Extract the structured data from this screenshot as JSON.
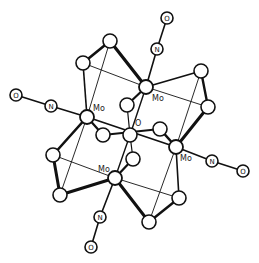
{
  "diagram": {
    "title": "",
    "colors": {
      "stroke": "#111111",
      "fill": "#ffffff",
      "background": "#ffffff"
    },
    "atoms": [
      {
        "id": "mo_top",
        "element": "Mo",
        "label": "Mo",
        "x": 146,
        "y": 87,
        "r": 7,
        "show_label": true,
        "label_dx": 6,
        "label_dy": 14
      },
      {
        "id": "mo_left",
        "element": "Mo",
        "label": "Mo",
        "x": 87,
        "y": 117,
        "r": 7,
        "show_label": true,
        "label_dx": 6,
        "label_dy": -6
      },
      {
        "id": "mo_right",
        "element": "Mo",
        "label": "Mo",
        "x": 176,
        "y": 147,
        "r": 7,
        "show_label": true,
        "label_dx": 4,
        "label_dy": 14
      },
      {
        "id": "mo_bottom",
        "element": "Mo",
        "label": "Mo",
        "x": 115,
        "y": 178,
        "r": 7,
        "show_label": true,
        "label_dx": -17,
        "label_dy": -6
      },
      {
        "id": "o_center",
        "element": "O",
        "label": "O",
        "x": 130,
        "y": 135,
        "r": 7,
        "show_label": true,
        "label_dx": 5,
        "label_dy": -9
      },
      {
        "id": "n_top",
        "element": "N",
        "label": "N",
        "x": 157,
        "y": 49,
        "r": 6,
        "show_label": true,
        "inner": true
      },
      {
        "id": "o_top",
        "element": "O",
        "label": "O",
        "x": 167,
        "y": 18,
        "r": 6,
        "show_label": true,
        "inner": true
      },
      {
        "id": "n_left",
        "element": "N",
        "label": "N",
        "x": 51,
        "y": 106,
        "r": 6,
        "show_label": true,
        "inner": true
      },
      {
        "id": "o_left",
        "element": "O",
        "label": "O",
        "x": 16,
        "y": 95,
        "r": 6,
        "show_label": true,
        "inner": true
      },
      {
        "id": "n_right",
        "element": "N",
        "label": "N",
        "x": 212,
        "y": 161,
        "r": 6,
        "show_label": true,
        "inner": true
      },
      {
        "id": "o_right",
        "element": "O",
        "label": "O",
        "x": 243,
        "y": 171,
        "r": 6,
        "show_label": true,
        "inner": true
      },
      {
        "id": "n_bottom",
        "element": "N",
        "label": "N",
        "x": 100,
        "y": 217,
        "r": 6,
        "show_label": true,
        "inner": true
      },
      {
        "id": "o_bottom",
        "element": "O",
        "label": "O",
        "x": 91,
        "y": 247,
        "r": 6,
        "show_label": true,
        "inner": true
      },
      {
        "id": "a_top",
        "element": "",
        "x": 110,
        "y": 41,
        "r": 7
      },
      {
        "id": "a_ul",
        "element": "",
        "x": 83,
        "y": 63,
        "r": 7
      },
      {
        "id": "a_ur",
        "element": "",
        "x": 201,
        "y": 71,
        "r": 7
      },
      {
        "id": "a_r",
        "element": "",
        "x": 208,
        "y": 107,
        "r": 7
      },
      {
        "id": "a_inner_up",
        "element": "",
        "x": 127,
        "y": 105,
        "r": 7
      },
      {
        "id": "a_mid_l",
        "element": "",
        "x": 103,
        "y": 135,
        "r": 7
      },
      {
        "id": "a_mid_r",
        "element": "",
        "x": 160,
        "y": 129,
        "r": 7
      },
      {
        "id": "a_inner_dn",
        "element": "",
        "x": 133,
        "y": 159,
        "r": 7
      },
      {
        "id": "a_l",
        "element": "",
        "x": 53,
        "y": 155,
        "r": 7
      },
      {
        "id": "a_ll",
        "element": "",
        "x": 60,
        "y": 195,
        "r": 7
      },
      {
        "id": "a_lr",
        "element": "",
        "x": 179,
        "y": 198,
        "r": 7
      },
      {
        "id": "a_bot",
        "element": "",
        "x": 149,
        "y": 222,
        "r": 7
      }
    ],
    "bonds": [
      {
        "from": "mo_top",
        "to": "n_top",
        "w": 1.6
      },
      {
        "from": "n_top",
        "to": "o_top",
        "w": 1.6
      },
      {
        "from": "mo_left",
        "to": "n_left",
        "w": 1.6
      },
      {
        "from": "n_left",
        "to": "o_left",
        "w": 1.6
      },
      {
        "from": "mo_right",
        "to": "n_right",
        "w": 1.6
      },
      {
        "from": "n_right",
        "to": "o_right",
        "w": 1.6
      },
      {
        "from": "mo_bottom",
        "to": "n_bottom",
        "w": 1.6
      },
      {
        "from": "n_bottom",
        "to": "o_bottom",
        "w": 1.6
      },
      {
        "from": "a_top",
        "to": "a_ul",
        "w": 2.6
      },
      {
        "from": "a_top",
        "to": "mo_top",
        "w": 3.2
      },
      {
        "from": "a_top",
        "to": "mo_left",
        "w": 0.9
      },
      {
        "from": "a_ul",
        "to": "mo_left",
        "w": 1.6
      },
      {
        "from": "a_ul",
        "to": "mo_top",
        "w": 0.9
      },
      {
        "from": "a_ur",
        "to": "mo_top",
        "w": 1.8
      },
      {
        "from": "a_ur",
        "to": "a_r",
        "w": 2.4
      },
      {
        "from": "a_ur",
        "to": "mo_right",
        "w": 0.9
      },
      {
        "from": "a_r",
        "to": "mo_right",
        "w": 3.0
      },
      {
        "from": "a_r",
        "to": "mo_top",
        "w": 0.9
      },
      {
        "from": "a_l",
        "to": "mo_left",
        "w": 2.6
      },
      {
        "from": "a_l",
        "to": "a_ll",
        "w": 3.0
      },
      {
        "from": "a_l",
        "to": "mo_bottom",
        "w": 0.9
      },
      {
        "from": "a_ll",
        "to": "mo_bottom",
        "w": 3.2
      },
      {
        "from": "a_ll",
        "to": "mo_left",
        "w": 0.9
      },
      {
        "from": "a_lr",
        "to": "mo_right",
        "w": 1.6
      },
      {
        "from": "a_lr",
        "to": "a_bot",
        "w": 2.4
      },
      {
        "from": "a_lr",
        "to": "mo_bottom",
        "w": 0.9
      },
      {
        "from": "a_bot",
        "to": "mo_bottom",
        "w": 3.0
      },
      {
        "from": "a_bot",
        "to": "mo_right",
        "w": 0.9
      },
      {
        "from": "mo_left",
        "to": "a_mid_l",
        "w": 2.2
      },
      {
        "from": "mo_left",
        "to": "mo_right",
        "w": 1.8
      },
      {
        "from": "a_mid_l",
        "to": "a_mid_r",
        "w": 1.8
      },
      {
        "from": "a_mid_r",
        "to": "mo_right",
        "w": 2.6
      },
      {
        "from": "mo_top",
        "to": "a_inner_up",
        "w": 2.2
      },
      {
        "from": "mo_top",
        "to": "o_center",
        "w": 1.4
      },
      {
        "from": "a_inner_up",
        "to": "o_center",
        "w": 1.2
      },
      {
        "from": "o_center",
        "to": "mo_bottom",
        "w": 1.4
      },
      {
        "from": "o_center",
        "to": "a_inner_dn",
        "w": 1.2
      },
      {
        "from": "a_inner_dn",
        "to": "mo_bottom",
        "w": 2.2
      }
    ]
  }
}
